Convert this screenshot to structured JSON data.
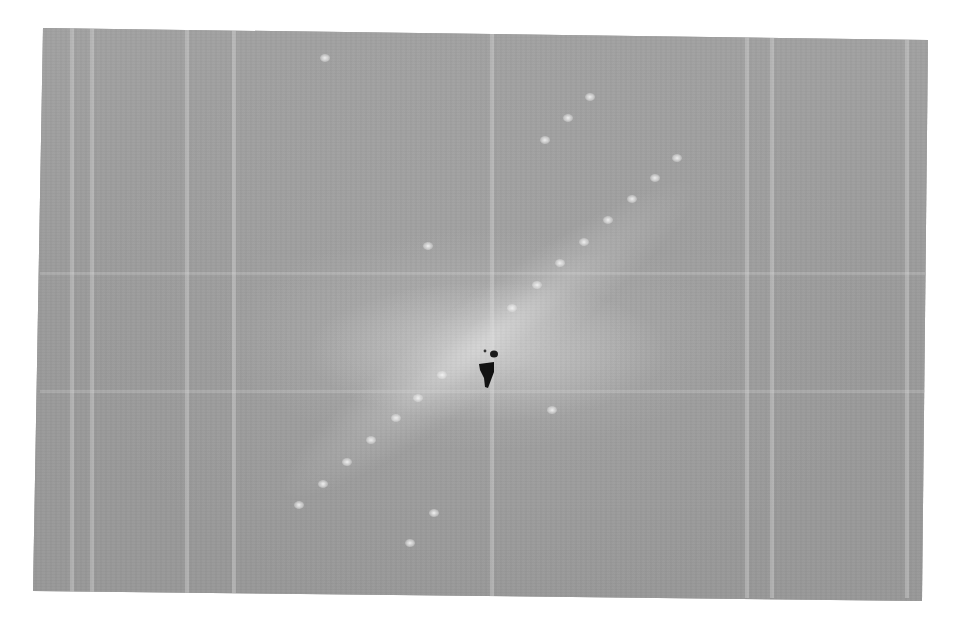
{
  "image": {
    "description": "Scanned electron/X-ray diffraction (or FFT) pattern on gray background with diagonal row of bright spots and dark beam-stop at center",
    "background_gray": "#9d9d9d",
    "page_background": "#ffffff",
    "beamstop_color": "#111111",
    "center": [
      488,
      372
    ]
  },
  "spots": [
    {
      "x": 677,
      "y": 158
    },
    {
      "x": 655,
      "y": 178
    },
    {
      "x": 632,
      "y": 199
    },
    {
      "x": 608,
      "y": 220
    },
    {
      "x": 584,
      "y": 242
    },
    {
      "x": 560,
      "y": 263
    },
    {
      "x": 537,
      "y": 285
    },
    {
      "x": 512,
      "y": 308
    },
    {
      "x": 442,
      "y": 375
    },
    {
      "x": 418,
      "y": 398
    },
    {
      "x": 396,
      "y": 418
    },
    {
      "x": 371,
      "y": 440
    },
    {
      "x": 347,
      "y": 462
    },
    {
      "x": 323,
      "y": 484
    },
    {
      "x": 299,
      "y": 505
    },
    {
      "x": 545,
      "y": 140
    },
    {
      "x": 568,
      "y": 118
    },
    {
      "x": 590,
      "y": 97
    },
    {
      "x": 428,
      "y": 246
    },
    {
      "x": 552,
      "y": 410
    },
    {
      "x": 434,
      "y": 513
    },
    {
      "x": 410,
      "y": 543
    },
    {
      "x": 325,
      "y": 58
    }
  ],
  "vertical_lines": [
    70,
    90,
    185,
    232,
    490,
    745,
    770,
    905
  ],
  "horizontal_lines": [
    272,
    390
  ]
}
